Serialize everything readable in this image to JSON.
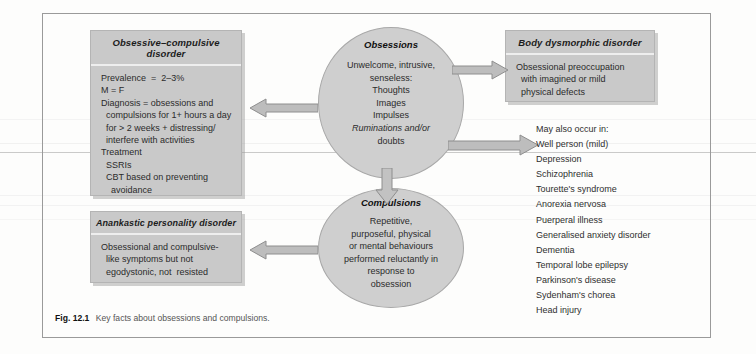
{
  "figure": {
    "caption_label": "Fig. 12.1",
    "caption_text": "Key facts about obsessions and compulsions."
  },
  "boxes": {
    "ocd": {
      "title": "Obsessive–compulsive disorder",
      "lines": [
        "Prevalence  =  2–3%",
        "M = F",
        "Diagnosis = obsessions and",
        "  compulsions for 1+ hours a day",
        "  for > 2 weeks + distressing/",
        "  interfere with activities",
        "Treatment",
        "  SSRIs",
        "  CBT based on preventing",
        "    avoidance"
      ]
    },
    "bdd": {
      "title": "Body dysmorphic disorder",
      "lines": [
        "Obsessional preoccupation",
        "  with imagined or mild",
        "  physical defects"
      ]
    },
    "anankastic": {
      "title": "Anankastic personality disorder",
      "lines": [
        "Obsessional and compulsive-",
        "  like symptoms but not",
        "  egodystonic, not  resisted"
      ]
    }
  },
  "ellipses": {
    "obsessions": {
      "title": "Obsessions",
      "lines": [
        "Unwelcome, intrusive,",
        "senseless:",
        "Thoughts",
        "Images",
        "Impulses",
        "Ruminations and/or",
        "doubts"
      ]
    },
    "compulsions": {
      "title": "Compulsions",
      "lines": [
        "Repetitive,",
        "purposeful, physical",
        "or mental behaviours",
        "performed reluctantly in",
        "response to",
        "obsession"
      ]
    }
  },
  "may_also_occur": {
    "heading": "May also occur in:",
    "items": [
      "Well person (mild)",
      "Depression",
      "Schizophrenia",
      "Tourette's syndrome",
      "Anorexia nervosa",
      "Puerperal illness",
      "Generalised anxiety disorder",
      "Dementia",
      "Temporal lobe epilepsy",
      "Parkinson's disease",
      "Sydenham's chorea",
      "Head injury"
    ]
  },
  "arrows": {
    "to_ocd": "arrow-left-to-ocd",
    "to_bdd": "arrow-right-to-bdd",
    "to_list": "arrow-right-to-list",
    "to_compulsions": "arrow-down-to-compulsions",
    "to_anankastic": "arrow-left-to-anankastic"
  },
  "colors": {
    "box_fill": "#c9c9c9",
    "ellipse_fill": "#cfcfcf",
    "arrow_fill": "#b9b9b9",
    "frame_border": "#9a9a9a",
    "page_bg": "#fdfdfc"
  }
}
